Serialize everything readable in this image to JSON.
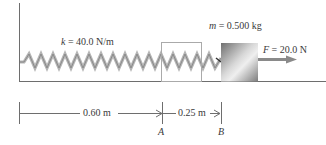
{
  "diagram": {
    "spring": {
      "label_var": "k",
      "label_rest": " = 40.0 N/m"
    },
    "block": {
      "label_var": "m",
      "label_rest": " = 0.500 kg"
    },
    "force": {
      "label_var": "F",
      "label_rest": " = 20.0 N"
    },
    "dimensions": [
      {
        "label": "0.60 m"
      },
      {
        "label": "0.25 m"
      }
    ],
    "points": [
      {
        "label": "A"
      },
      {
        "label": "B"
      }
    ],
    "colors": {
      "line": "#6e6e6e",
      "spring": "#9a9a9a",
      "block_dark": "#7a7a7a",
      "block_light": "#e6e6e6",
      "arrow": "#8a8a8a"
    }
  }
}
